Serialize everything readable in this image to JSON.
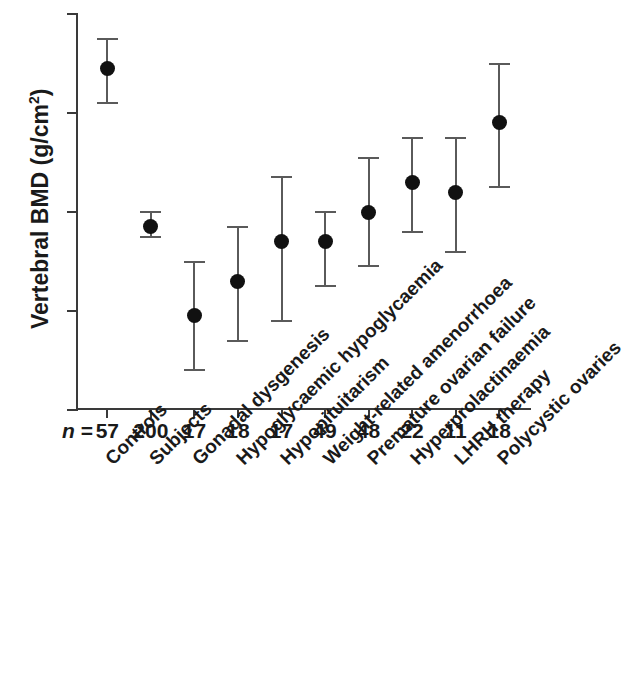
{
  "chart_data": {
    "type": "scatter",
    "title": "",
    "xlabel": "",
    "ylabel": "Vertebral BMD (g/cm",
    "ylabel_sup": "2",
    "ylabel_suffix": ")",
    "ylim": [
      0.6,
      1.4
    ],
    "grid": false,
    "legend": "none",
    "error_bar_style": "mean with 95% CI caps",
    "y_ticks": [
      {
        "value": 1.4,
        "label": "1."
      },
      {
        "value": 1.2,
        "label": "1."
      },
      {
        "value": 1.0,
        "label": "0."
      },
      {
        "value": 0.8,
        "label": "0."
      },
      {
        "value": 0.6,
        "label": "0."
      }
    ],
    "n_prefix": "n =",
    "categories": [
      "Controls",
      "Subjects",
      "Gonadal dysgenesis",
      "Hypoglycaemic hypoglycaemia",
      "Hypopituitarism",
      "Weight-related amenorrhoea",
      "Premature ovarian failure",
      "Hyperprolactinaemia",
      "LHRH therapy",
      "Polycystic ovaries"
    ],
    "n_values": [
      57,
      200,
      17,
      18,
      17,
      49,
      48,
      22,
      11,
      18
    ],
    "values": [
      1.29,
      0.97,
      0.79,
      0.86,
      0.94,
      0.94,
      1.0,
      1.06,
      1.04,
      1.18
    ],
    "lower": [
      1.22,
      0.95,
      0.68,
      0.74,
      0.78,
      0.85,
      0.89,
      0.96,
      0.92,
      1.05
    ],
    "upper": [
      1.35,
      1.0,
      0.9,
      0.97,
      1.07,
      1.0,
      1.11,
      1.15,
      1.15,
      1.3
    ],
    "marker_color": "#111111",
    "error_color": "#5a5a5a",
    "axis_color": "#3a3a3a"
  }
}
